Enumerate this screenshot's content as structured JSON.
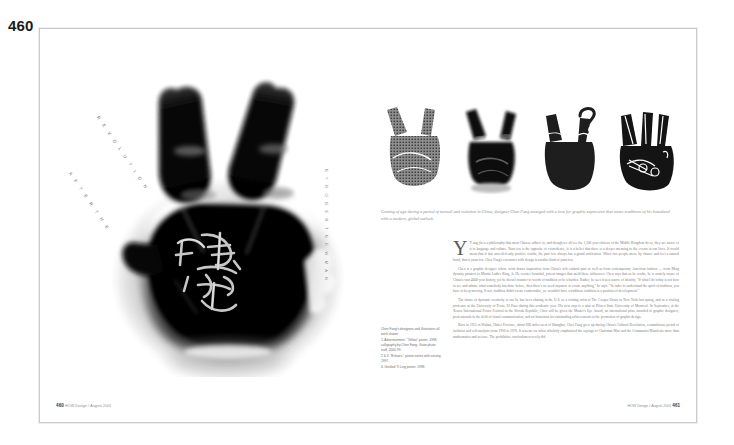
{
  "page_number": "460",
  "spread": {
    "left_page": {
      "headline_line1": "R E V O L U T I O N",
      "headline_line2": "A F T E R   T H E",
      "byline": "B Y   R O B E R T   N E W M A N",
      "artwork_name": "x-ray-hand-peace-sign",
      "calligraphy_name": "chinese-calligraphy-signature",
      "folio_number": "460",
      "folio_text": "HOW Design  /  August 2001"
    },
    "right_page": {
      "thumbnails": [
        {
          "label": "hand-variant-halftone-texture"
        },
        {
          "label": "hand-variant-xray-dark"
        },
        {
          "label": "hand-variant-silhouette-question-mark"
        },
        {
          "label": "hand-variant-line-drawing-scissors"
        }
      ],
      "caption": "Coming of age during a period of turmoil and isolation in China, designer Chen Fang emerged with a love for graphic expression that mixes traditions of his homeland with a modern, global outlook.",
      "credits": [
        "Chen Fang's designers and illustrators all work shown:",
        "1. Advertisement, \"Yellow\" poster, 1998, calligraphy by Chen Fang, Guan photo staff, 2000-99.",
        "2 & 3. \"Echoes,\" poster series with society, 1997.",
        "4. Untitled Yi Ling poster, 1998."
      ],
      "body": [
        "Y  ang jin is a philosophy that most Chinese adhere to, and though we all see the 1,100 year citizens of the Middle Kingdom do so, they are aware of it in language and culture. Yuan fen is the opposite of coincidence, it is a belief that there is a deeper meaning to the events in our lives. It would mean that if fate unveiled only positive results, the past few always has a grand unification. When two people move by chance and feel a natural bond, that is yuan fen. Chen Fang's encounter with design is another kind of yuan fen.",
        "Chen is a graphic designer whose work draws inspiration from China's rich cultural past as well as from contemporary American fashion — from Ming dynasty painters to Martin Luther King, Jr. He creates beautiful, potent images that meld these influences. Chen says that as he works, he is acutely aware of China's vast 4000-year history, yet he doesn't transfer to words of tradition or be a burden. Rather, he sees it as a source of identity. \"If what I do today is not how to see and admire what somebody has done before, then there's no need anymore to create anything,\" he says. \"In order to understand the spirit of tradition, you have to keep moving. If not, tradition didn't create comfortable, we wouldn't have a tradition: tradition is a position of development.\"",
        "The future of dynamic creativity is one he has been sharing in the U.S. as a visiting artist at The Cooper Union in New York last spring, and as a visiting professor at the University of Texas, El Paso during this academic year. His next stop is a stint at Plitzen State University of Montreal. In September, at the Xenon International Poster Festival in the Slovak Republic, Chen will be given the Master's Eye Award, an international prize awarded to graphic designers, professionals in the field of visual communication, and art historians for outstanding achievements in the promotion of graphic design.",
        "Born in 1955 in Wuhan, Hubei Province, about 690 miles west of Shanghai, Chen Fang grew up during China's Cultural Revolution, a tumultuous period of isolation and self-analysis from 1966 to 1976. It was an era when scholarly emphasized the sayings of Chairman Mao and the Communist Manifesto more than mathematics and science. The prohibitive curriculum severely did"
      ],
      "folio_number": "461",
      "folio_text": "HOW Design  /  August 2001"
    }
  }
}
